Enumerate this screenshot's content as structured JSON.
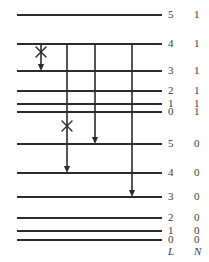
{
  "figure": {
    "type": "energy-level-diagram",
    "line_color": "#2b2b2b",
    "background": "#ffffff",
    "width": 209,
    "height": 262,
    "line_x_start": 17,
    "line_x_end": 162
  },
  "columns": {
    "L_header": "L",
    "N_header": "N",
    "header_y": 251,
    "L_x": 168,
    "N_x": 194
  },
  "levels": [
    {
      "id": "lvl-n1-L5",
      "L": "5",
      "N": "1",
      "y": 15
    },
    {
      "id": "lvl-n1-L4",
      "L": "4",
      "N": "1",
      "y": 44
    },
    {
      "id": "lvl-n1-L3",
      "L": "3",
      "N": "1",
      "y": 71
    },
    {
      "id": "lvl-n1-L2",
      "L": "2",
      "N": "1",
      "y": 91
    },
    {
      "id": "lvl-n1-L1",
      "L": "1",
      "N": "1",
      "y": 104
    },
    {
      "id": "lvl-n1-L0",
      "L": "0",
      "N": "1",
      "y": 112
    },
    {
      "id": "lvl-n0-L5",
      "L": "5",
      "N": "0",
      "y": 144
    },
    {
      "id": "lvl-n0-L4",
      "L": "4",
      "N": "0",
      "y": 173
    },
    {
      "id": "lvl-n0-L3",
      "L": "3",
      "N": "0",
      "y": 197
    },
    {
      "id": "lvl-n0-L2",
      "L": "2",
      "N": "0",
      "y": 218
    },
    {
      "id": "lvl-n0-L1",
      "L": "1",
      "N": "0",
      "y": 231
    },
    {
      "id": "lvl-n0-L0",
      "L": "0",
      "N": "0",
      "y": 240
    }
  ],
  "transitions": [
    {
      "id": "transition-forbidden-4to3",
      "x": 41,
      "y_start": 44,
      "y_end": 71,
      "forbidden": true,
      "x_mark_y": 52,
      "from_label": "4",
      "to_label": "3"
    },
    {
      "id": "transition-4to4",
      "x": 67,
      "y_start": 44,
      "y_end": 173,
      "forbidden": true,
      "x_mark_y": 126,
      "from_label": "4",
      "to_label": "4"
    },
    {
      "id": "transition-4to5",
      "x": 95,
      "y_start": 44,
      "y_end": 144,
      "forbidden": false,
      "x_mark_y": null,
      "from_label": "4",
      "to_label": "5"
    },
    {
      "id": "transition-4to3-lower",
      "x": 132,
      "y_start": 44,
      "y_end": 197,
      "forbidden": false,
      "x_mark_y": null,
      "from_label": "4",
      "to_label": "3"
    }
  ],
  "x_markers": [
    {
      "id": "x-marker-upper",
      "x": 41,
      "y": 52,
      "size": 5
    },
    {
      "id": "x-marker-lower",
      "x": 67,
      "y": 126,
      "size": 5
    }
  ]
}
